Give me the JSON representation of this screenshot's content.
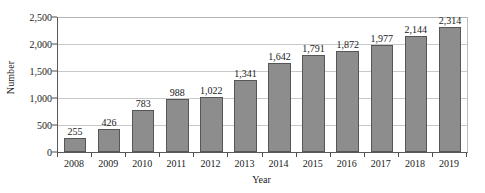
{
  "chart_data": {
    "type": "bar",
    "title": "",
    "xlabel": "Year",
    "ylabel": "Number",
    "categories": [
      "2008",
      "2009",
      "2010",
      "2011",
      "2012",
      "2013",
      "2014",
      "2015",
      "2016",
      "2017",
      "2018",
      "2019"
    ],
    "values": [
      255,
      426,
      783,
      988,
      1022,
      1341,
      1642,
      1791,
      1872,
      1977,
      2144,
      2314
    ],
    "value_labels": [
      "255",
      "426",
      "783",
      "988",
      "1,022",
      "1,341",
      "1,642",
      "1,791",
      "1,872",
      "1,977",
      "2,144",
      "2,314"
    ],
    "ylim": [
      0,
      2500
    ],
    "y_ticks": [
      0,
      500,
      1000,
      1500,
      2000,
      2500
    ],
    "y_tick_labels": [
      "0",
      "500",
      "1,000",
      "1,500",
      "2,000",
      "2,500"
    ],
    "grid": "horizontal",
    "legend": "none",
    "series": [
      {
        "name": "Number",
        "values": [
          255,
          426,
          783,
          988,
          1022,
          1341,
          1642,
          1791,
          1872,
          1977,
          2144,
          2314
        ],
        "color": "#8d8d8d",
        "edge_color": "#565656"
      }
    ],
    "colors": {
      "bar_fill": "#8d8d8d",
      "bar_edge": "#565656",
      "gridline": "#c8c8c8",
      "axis": "#595959",
      "text": "#1a1a1a",
      "background": "#ffffff"
    }
  }
}
